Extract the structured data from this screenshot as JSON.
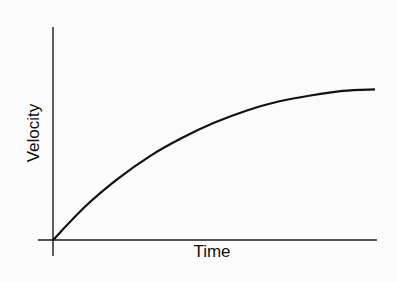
{
  "chart_data": {
    "type": "line",
    "title": "",
    "xlabel": "Time",
    "ylabel": "Velocity",
    "grid": false,
    "legend": null,
    "x_ticks": [],
    "y_ticks": [],
    "series": [
      {
        "name": "Velocity vs Time",
        "description": "Concave-down curve rising from origin and leveling off toward a terminal value",
        "x": [
          0,
          0.1,
          0.2,
          0.3,
          0.4,
          0.5,
          0.6,
          0.7,
          0.8,
          0.9,
          1.0
        ],
        "values": [
          0,
          0.22,
          0.4,
          0.55,
          0.67,
          0.77,
          0.85,
          0.91,
          0.95,
          0.98,
          0.99
        ]
      }
    ],
    "xlim": [
      0,
      1
    ],
    "ylim": [
      0,
      1.4
    ]
  },
  "colors": {
    "background": "#fbfbfb",
    "line": "#111111"
  }
}
